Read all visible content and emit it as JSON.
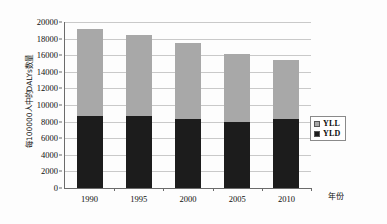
{
  "chart_data": {
    "type": "bar",
    "subtype": "stacked-column",
    "title": "",
    "xlabel": "年份",
    "ylabel": "每100000人中的DALYs数量",
    "categories": [
      "1990",
      "1995",
      "2000",
      "2005",
      "2010"
    ],
    "series": [
      {
        "name": "YLD",
        "color": "#1c1c1c",
        "values": [
          8700,
          8700,
          8300,
          8000,
          8300
        ]
      },
      {
        "name": "YLL",
        "color": "#a8a8a8",
        "values": [
          10500,
          9700,
          9200,
          8100,
          7100
        ]
      }
    ],
    "totals": [
      19200,
      18400,
      17500,
      16100,
      15400
    ],
    "ylim": [
      0,
      20000
    ],
    "ytick_step": 2000,
    "yticks": [
      "20000",
      "18000",
      "16000",
      "14000",
      "12000",
      "10000",
      "8000",
      "6000",
      "4000",
      "2000",
      "0"
    ],
    "ytick_values": [
      20000,
      18000,
      16000,
      14000,
      12000,
      10000,
      8000,
      6000,
      4000,
      2000,
      0
    ],
    "grid": true,
    "legend_position": "right",
    "legend": [
      {
        "label": "YLL",
        "color": "#a8a8a8"
      },
      {
        "label": "YLD",
        "color": "#1c1c1c"
      }
    ]
  }
}
